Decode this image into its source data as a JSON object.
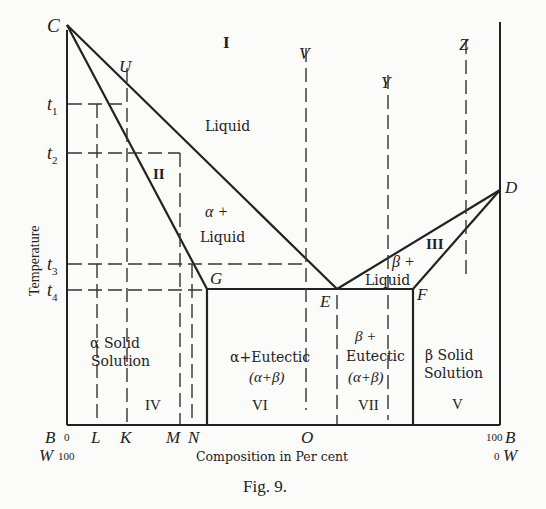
{
  "figure": {
    "caption": "Fig. 9.",
    "x_axis_label": "Composition in Per cent",
    "y_axis_label": "Temperature",
    "axis_ends": {
      "left_top": "B",
      "left_top_value": "0",
      "left_bottom": "W",
      "left_bottom_value": "100",
      "right_top": "B",
      "right_top_value": "100",
      "right_bottom": "W",
      "right_bottom_value": "0"
    },
    "temperatures": [
      "t1",
      "t2",
      "t3",
      "t4"
    ],
    "temperature_labels": [
      {
        "base": "t",
        "sub": "1"
      },
      {
        "base": "t",
        "sub": "2"
      },
      {
        "base": "t",
        "sub": "3"
      },
      {
        "base": "t",
        "sub": "4"
      }
    ],
    "points": {
      "C": "C",
      "D": "D",
      "E": "E",
      "F": "F",
      "G": "G"
    },
    "composition_marks": [
      "L",
      "K",
      "M",
      "N",
      "O"
    ],
    "vertical_line_labels": [
      "U",
      "V",
      "Y",
      "Z"
    ],
    "regions": {
      "I": "I",
      "II": "II",
      "III": "III",
      "IV": "IV",
      "V": "V",
      "VI": "VI",
      "VII": "VII",
      "liquid": "Liquid",
      "alpha_liquid_1": "α +",
      "alpha_liquid_2": "Liquid",
      "beta_liquid_1": "β +",
      "beta_liquid_2": "Liquid",
      "alpha_solid_1": "α  Solid",
      "alpha_solid_2": "Solution",
      "alpha_eutectic_1": "α+Eutectic",
      "alpha_eutectic_2": "(α+β)",
      "beta_eutectic_1": "β +",
      "beta_eutectic_2": "Eutectic",
      "beta_eutectic_3": "(α+β)",
      "beta_solid_1": "β  Solid",
      "beta_solid_2": "Solution"
    }
  }
}
